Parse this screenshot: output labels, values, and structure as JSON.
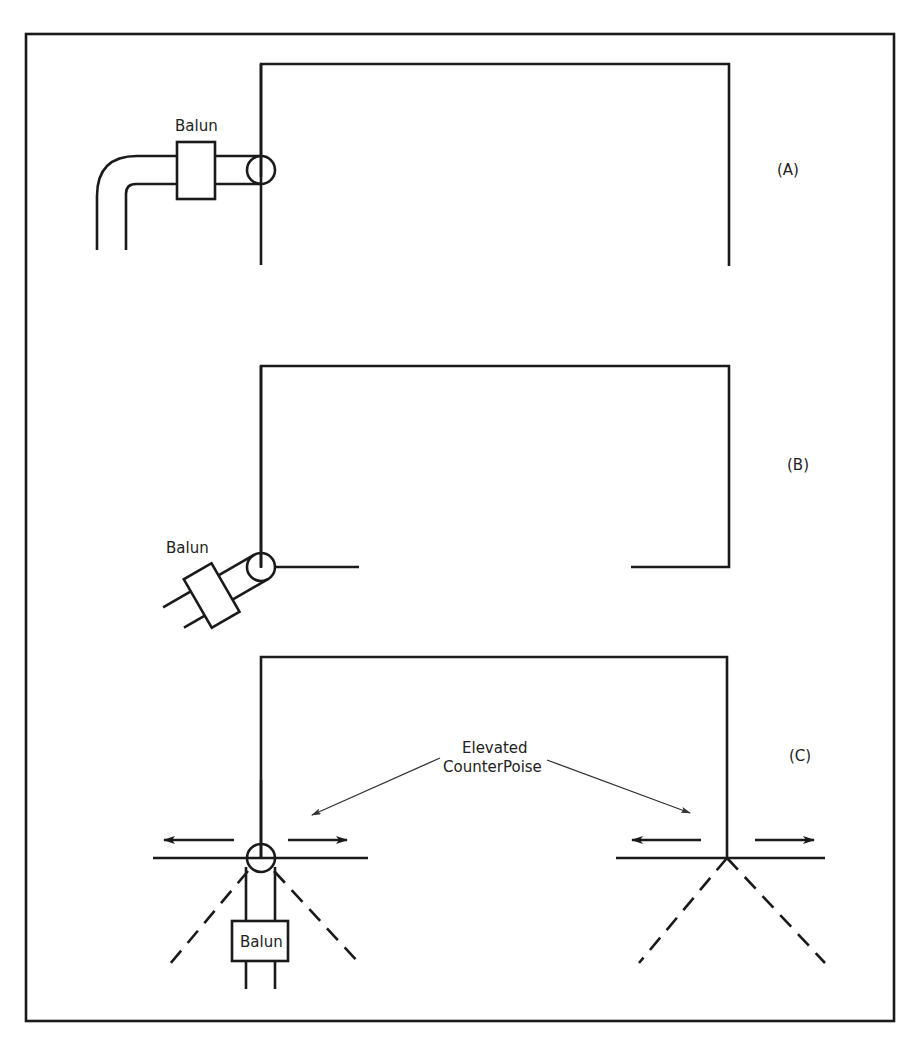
{
  "figure": {
    "panels": [
      {
        "id": "A",
        "label": "(A)",
        "balun_label": "Balun"
      },
      {
        "id": "B",
        "label": "(B)",
        "balun_label": "Balun"
      },
      {
        "id": "C",
        "label": "(C)",
        "balun_label": "Balun",
        "annotation_line1": "Elevated",
        "annotation_line2": "CounterPoise"
      }
    ]
  },
  "colors": {
    "ink": "#1a1a1a",
    "background": "#ffffff"
  }
}
